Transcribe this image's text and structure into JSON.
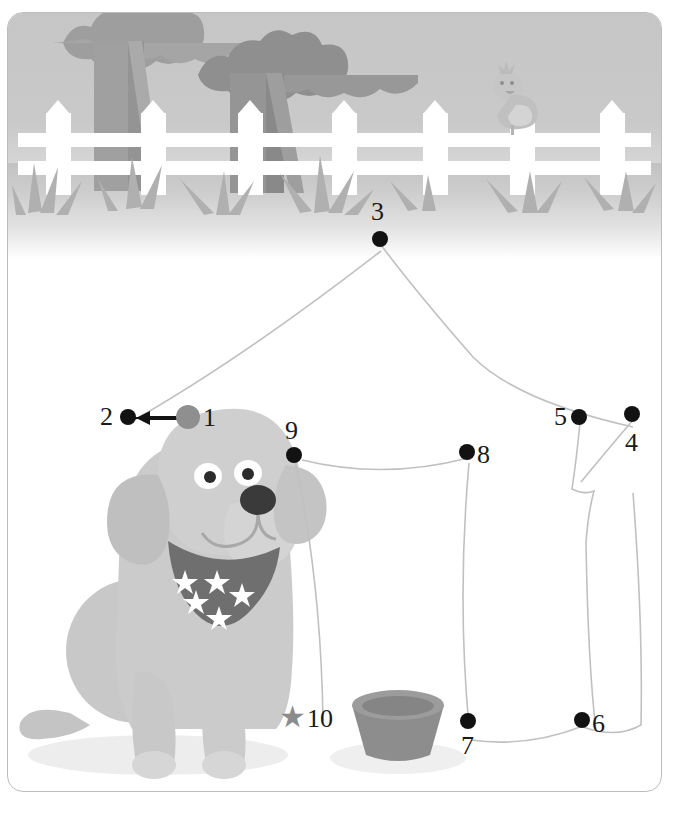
{
  "page": {
    "worksheet_type": "dot-to-dot puzzle",
    "frame_border_color": "#bdbdbd",
    "background_color": "#ffffff"
  },
  "scene": {
    "sky_color": "#c8c8c8",
    "ground_color": "#c5c5c5",
    "fence_color": "#ffffff",
    "tree_canopy_color": "#a8a8a8",
    "tree_trunk_color": "#9f9f9f",
    "grass_color": "#b4b4b4",
    "bird": {
      "name": "bird",
      "body_color": "#c3c3c3"
    }
  },
  "dog": {
    "name": "dog",
    "body_color": "#c9c9c9",
    "ear_color": "#bdbdbd",
    "nose_color": "#3a3a3a",
    "bandana_color": "#6f6f6f",
    "bandana_stars": 5,
    "eye_white_color": "#ffffff"
  },
  "bowl": {
    "name": "dog-bowl",
    "color": "#8f8f8f",
    "rim_color": "#9c9c9c"
  },
  "puzzle": {
    "start_label": "1",
    "start_marker_color": "#8f8f8f",
    "dot_color": "#121212",
    "arrow_direction": "left",
    "star_glyph": "★",
    "star_label": "10",
    "dots": [
      {
        "id": 1,
        "label": "1",
        "x": 188,
        "y": 417,
        "label_x": 203,
        "label_y": 405,
        "type": "start"
      },
      {
        "id": 2,
        "label": "2",
        "x": 128,
        "y": 417,
        "label_x": 100,
        "label_y": 404,
        "type": "dot"
      },
      {
        "id": 3,
        "label": "3",
        "x": 380,
        "y": 239,
        "label_x": 371,
        "label_y": 199,
        "type": "dot"
      },
      {
        "id": 4,
        "label": "4",
        "x": 632,
        "y": 414,
        "label_x": 625,
        "label_y": 430,
        "type": "dot"
      },
      {
        "id": 5,
        "label": "5",
        "x": 579,
        "y": 417,
        "label_x": 554,
        "label_y": 404,
        "type": "dot"
      },
      {
        "id": 6,
        "label": "6",
        "x": 582,
        "y": 720,
        "label_x": 592,
        "label_y": 711,
        "type": "dot"
      },
      {
        "id": 7,
        "label": "7",
        "x": 468,
        "y": 721,
        "label_x": 461,
        "label_y": 733,
        "type": "dot"
      },
      {
        "id": 8,
        "label": "8",
        "x": 467,
        "y": 452,
        "label_x": 477,
        "label_y": 442,
        "type": "dot"
      },
      {
        "id": 9,
        "label": "9",
        "x": 294,
        "y": 455,
        "label_x": 285,
        "label_y": 418,
        "type": "dot"
      },
      {
        "id": 10,
        "label": "10",
        "x": 294,
        "y": 718,
        "label_x": 307,
        "label_y": 706,
        "type": "star"
      }
    ]
  }
}
